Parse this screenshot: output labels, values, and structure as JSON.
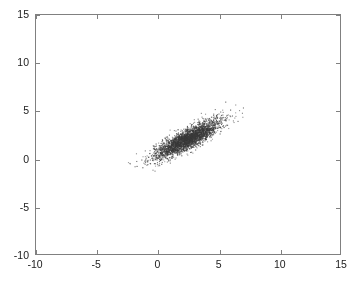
{
  "chart_data": {
    "type": "scatter",
    "title": "",
    "xlabel": "",
    "ylabel": "",
    "xlim": [
      -10,
      15
    ],
    "ylim": [
      -10,
      15
    ],
    "xticks": [
      -10,
      -5,
      0,
      5,
      10,
      15
    ],
    "yticks": [
      -10,
      -5,
      0,
      5,
      10,
      15
    ],
    "xtick_labels": [
      "-10",
      "-5",
      "0",
      "5",
      "10",
      "15"
    ],
    "ytick_labels": [
      "-10",
      "-5",
      "0",
      "5",
      "10",
      "15"
    ],
    "grid": false,
    "legend": null,
    "tick_direction": "in",
    "marker": {
      "style": "dot",
      "size_px": 1.1,
      "color": "#3a3a3a"
    },
    "axis_color": "#808080",
    "background_color": "#ffffff",
    "series": [
      {
        "name": "bivariate normal sample",
        "n_points": 3000,
        "description": "dense elongated elliptical cloud with positive correlation",
        "mean_x": 2.3,
        "mean_y": 2.15,
        "std_x": 1.35,
        "std_y": 1.0,
        "correlation": 0.85,
        "observed_x_range": [
          -1.3,
          6.1
        ],
        "observed_y_range": [
          -2.0,
          5.2
        ],
        "random_seed": 20240517
      }
    ]
  },
  "axes": {
    "x_tick_labels": [
      "-10",
      "-5",
      "0",
      "5",
      "10",
      "15"
    ],
    "y_tick_labels": [
      "15",
      "10",
      "5",
      "0",
      "-5",
      "-10"
    ]
  }
}
